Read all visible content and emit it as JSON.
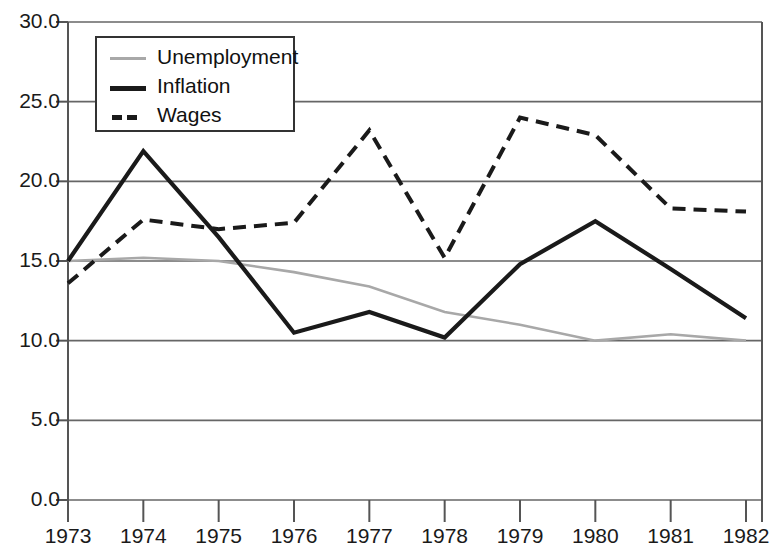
{
  "chart_data": {
    "type": "line",
    "title": "",
    "xlabel": "",
    "ylabel": "",
    "x": [
      1973,
      1974,
      1975,
      1976,
      1977,
      1978,
      1979,
      1980,
      1981,
      1982
    ],
    "categories": [
      "1973",
      "1974",
      "1975",
      "1976",
      "1977",
      "1978",
      "1979",
      "1980",
      "1981",
      "1982"
    ],
    "xlim": [
      1973,
      1982
    ],
    "ylim": [
      0.0,
      30.0
    ],
    "ytick_labels": [
      "0.0",
      "5.0",
      "10.0",
      "15.0",
      "20.0",
      "25.0",
      "30.0"
    ],
    "ytick_values": [
      0.0,
      5.0,
      10.0,
      15.0,
      20.0,
      25.0,
      30.0
    ],
    "grid": "horizontal",
    "legend_position": "top-left-inside",
    "series": [
      {
        "name": "Unemployment",
        "values": [
          15.0,
          15.2,
          15.0,
          14.3,
          13.4,
          11.8,
          11.0,
          10.0,
          10.4,
          10.0
        ],
        "color": "#a8a8a8",
        "style": "solid",
        "width": 2.6
      },
      {
        "name": "Inflation",
        "values": [
          15.0,
          21.9,
          16.5,
          10.5,
          11.8,
          10.2,
          14.8,
          17.5,
          14.5,
          11.4
        ],
        "color": "#1a1a1a",
        "style": "solid",
        "width": 4.2
      },
      {
        "name": "Wages",
        "values": [
          13.6,
          17.6,
          17.0,
          17.4,
          23.2,
          15.2,
          24.0,
          22.9,
          18.3,
          18.1
        ],
        "color": "#1a1a1a",
        "style": "dashed",
        "width": 4.0
      }
    ]
  },
  "legend": {
    "items": [
      {
        "label": "Unemployment"
      },
      {
        "label": "Inflation"
      },
      {
        "label": "Wages"
      }
    ]
  },
  "axes": {
    "axis_color": "#555555",
    "grid_color": "#666666"
  }
}
